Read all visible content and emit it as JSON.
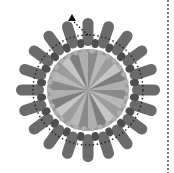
{
  "diagram": {
    "type": "radial-flower",
    "center": [
      88,
      90
    ],
    "outer_petals": {
      "count": 20,
      "inner_radius": 44,
      "outer_radius": 72,
      "width": 11,
      "color": "#6b6b6b"
    },
    "inner_petals": {
      "count": 20,
      "radius": 47,
      "length": 9,
      "width": 7,
      "color": "#4e4e4e"
    },
    "dotted_ring": {
      "radius": 55,
      "color": "#222222"
    },
    "disc": {
      "radius": 38,
      "wedges": 24,
      "base_color": "#a8a8a8",
      "edge_color": "#9a9a9a"
    },
    "arrow": {
      "x": 72,
      "y": 16,
      "color": "#111111"
    },
    "divider": {
      "x": 168,
      "style": "dotted",
      "color": "#777777"
    }
  }
}
